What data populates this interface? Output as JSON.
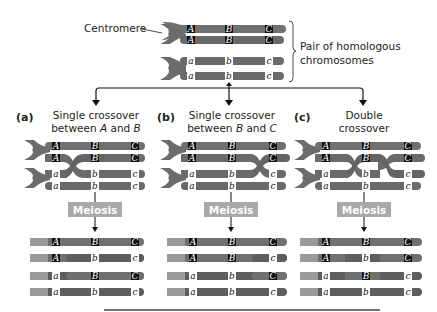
{
  "top": {
    "centromere_label": "Centromere",
    "pair_label_line1": "Pair of homologous",
    "pair_label_line2": "chromosomes",
    "chromosomes": [
      {
        "genes": [
          "A",
          "B",
          "C"
        ],
        "dominant": true
      },
      {
        "genes": [
          "A",
          "B",
          "C"
        ],
        "dominant": true
      },
      {
        "genes": [
          "a",
          "b",
          "c"
        ],
        "dominant": false
      },
      {
        "genes": [
          "a",
          "b",
          "c"
        ],
        "dominant": false
      }
    ]
  },
  "panels": [
    {
      "letter": "(a)",
      "title_line1": "Single crossover",
      "title_line2_pre": "between ",
      "title_line2_x": "A",
      "title_line2_mid": " and ",
      "title_line2_y": "B",
      "meiosis_label": "Meiosis",
      "products": [
        [
          "A",
          "B",
          "C"
        ],
        [
          "A",
          "b",
          "c"
        ],
        [
          "a",
          "B",
          "C"
        ],
        [
          "a",
          "b",
          "c"
        ]
      ]
    },
    {
      "letter": "(b)",
      "title_line1": "Single crossover",
      "title_line2_pre": "between ",
      "title_line2_x": "B",
      "title_line2_mid": " and ",
      "title_line2_y": "C",
      "meiosis_label": "Meiosis",
      "products": [
        [
          "A",
          "B",
          "C"
        ],
        [
          "A",
          "B",
          "c"
        ],
        [
          "a",
          "b",
          "C"
        ],
        [
          "a",
          "b",
          "c"
        ]
      ]
    },
    {
      "letter": "(c)",
      "title_line1": "Double",
      "title_line2": "crossover",
      "meiosis_label": "Meiosis",
      "products": [
        [
          "A",
          "B",
          "C"
        ],
        [
          "A",
          "b",
          "C"
        ],
        [
          "a",
          "B",
          "c"
        ],
        [
          "a",
          "b",
          "c"
        ]
      ]
    }
  ],
  "colors": {
    "chromatid_dark": "#6e6e6e",
    "chromatid_light": "#8a8a8a",
    "gene_dominant_bg": "#111111",
    "gene_recessive_bg": "#ffffff",
    "meiosis_box": "#a9a9a9",
    "arrow": "#111111"
  }
}
